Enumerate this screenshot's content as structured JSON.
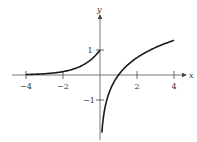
{
  "chart_data": {
    "type": "line",
    "title": "",
    "xlabel": "x",
    "ylabel": "y",
    "xlim": [
      -4.5,
      4.5
    ],
    "ylim": [
      -2.4,
      1.6
    ],
    "grid": false,
    "legend": null,
    "x_ticks": [
      -4,
      -2,
      2,
      4
    ],
    "x_tick_labels": [
      "−4",
      "−2",
      "2",
      "4"
    ],
    "y_ticks": [
      1,
      -1
    ],
    "y_tick_labels": [
      "1",
      "−1"
    ],
    "series": [
      {
        "name": "left branch (e^x, x<0)",
        "x": [
          -4,
          -3,
          -2,
          -1.5,
          -1,
          -0.5,
          0
        ],
        "y": [
          0.018,
          0.05,
          0.135,
          0.223,
          0.368,
          0.607,
          1.0
        ]
      },
      {
        "name": "right branch (ln x, x>0)",
        "x": [
          0.1,
          0.25,
          0.5,
          0.75,
          1,
          1.5,
          2,
          2.5,
          3,
          3.5,
          4
        ],
        "y": [
          -2.3,
          -1.39,
          -0.69,
          -0.29,
          0,
          0.41,
          0.69,
          0.92,
          1.1,
          1.25,
          1.39
        ]
      }
    ],
    "colors": {
      "curve": "#1a1a1a",
      "axes": "#555555"
    }
  },
  "labels": {
    "x_axis": "x",
    "y_axis": "y",
    "tick_neg4": "−4",
    "tick_neg2": "−2",
    "tick_2": "2",
    "tick_4": "4",
    "tick_y1": "1",
    "tick_yneg1": "−1"
  }
}
